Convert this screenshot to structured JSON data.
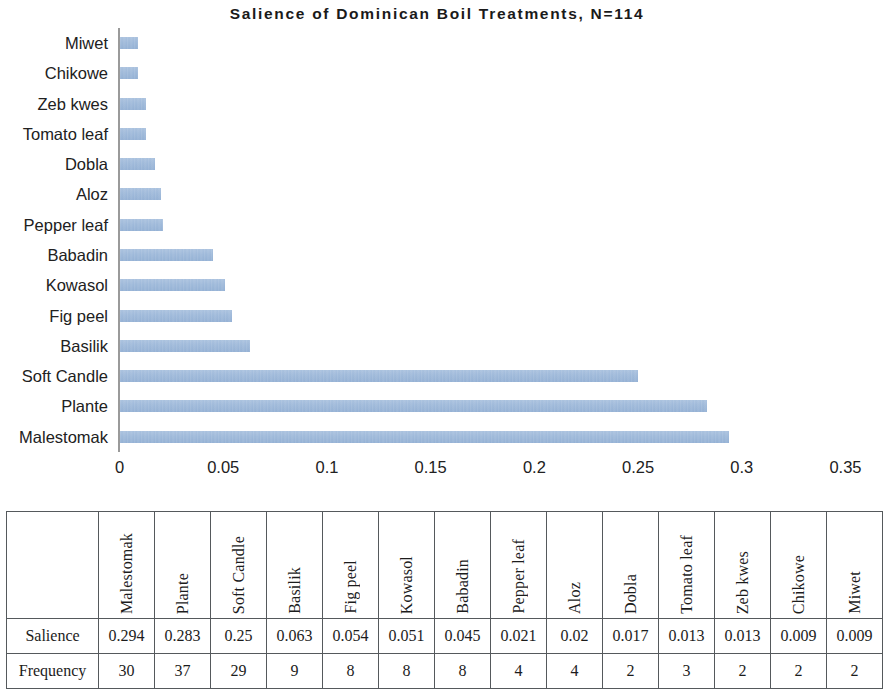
{
  "chart": {
    "title": "Salience of Dominican Boil Treatments, N=114",
    "bar_color": "#9db8d9",
    "axis_color": "#9a9a9a"
  },
  "chart_data": {
    "type": "bar",
    "orientation": "horizontal",
    "title": "Salience of Dominican Boil Treatments, N=114",
    "xlabel": "",
    "ylabel": "",
    "xlim": [
      0,
      0.35
    ],
    "xticks": [
      "0",
      "0.05",
      "0.1",
      "0.15",
      "0.2",
      "0.25",
      "0.3",
      "0.35"
    ],
    "xtick_values": [
      0,
      0.05,
      0.1,
      0.15,
      0.2,
      0.25,
      0.3,
      0.35
    ],
    "grid": false,
    "legend": false,
    "categories": [
      "Miwet",
      "Chikowe",
      "Zeb kwes",
      "Tomato leaf",
      "Dobla",
      "Aloz",
      "Pepper leaf",
      "Babadin",
      "Kowasol",
      "Fig peel",
      "Basilik",
      "Soft Candle",
      "Plante",
      "Malestomak"
    ],
    "values": [
      0.009,
      0.009,
      0.013,
      0.013,
      0.017,
      0.02,
      0.021,
      0.045,
      0.051,
      0.054,
      0.063,
      0.25,
      0.283,
      0.294
    ]
  },
  "table": {
    "corner_label": "",
    "column_headers": [
      "Malestomak",
      "Plante",
      "Soft Candle",
      "Basilik",
      "Fig peel",
      "Kowasol",
      "Babadin",
      "Pepper leaf",
      "Aloz",
      "Dobla",
      "Tomato leaf",
      "Zeb kwes",
      "Chikowe",
      "Miwet"
    ],
    "rows": [
      {
        "label": "Salience",
        "values": [
          "0.294",
          "0.283",
          "0.25",
          "0.063",
          "0.054",
          "0.051",
          "0.045",
          "0.021",
          "0.02",
          "0.017",
          "0.013",
          "0.013",
          "0.009",
          "0.009"
        ]
      },
      {
        "label": "Frequency",
        "values": [
          "30",
          "37",
          "29",
          "9",
          "8",
          "8",
          "8",
          "4",
          "4",
          "2",
          "3",
          "2",
          "2",
          "2"
        ]
      }
    ]
  }
}
